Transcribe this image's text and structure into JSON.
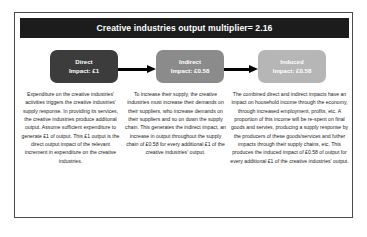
{
  "header": {
    "title": "Creative industries output multiplier= 2.16"
  },
  "flow": {
    "boxes": [
      {
        "name": "direct",
        "line1": "Direct",
        "line2": "Impact: £1",
        "color": "#3c3c3c"
      },
      {
        "name": "indirect",
        "line1": "Indirect",
        "line2": "Impact: £0.58",
        "color": "#8b8b8b"
      },
      {
        "name": "induced",
        "line1": "Induced",
        "line2": "Impact: £0.58",
        "color": "#b6b6b6"
      }
    ],
    "arrows": [
      {
        "name": "arrow-direct-to-indirect",
        "direction": "right"
      },
      {
        "name": "arrow-indirect-to-induced",
        "direction": "right"
      }
    ]
  },
  "columns": [
    {
      "name": "direct",
      "text": "Expenditure on the creative industries' activities triggers the creative industries' supply response. In providing its services, the creative industries produce additonal output. Assume sufficient expenditure to generate £1 of output. This £1 output is the direct output impact of the relevant increment in expenditure on the creative industries."
    },
    {
      "name": "indirect",
      "text": "To increase their supply, the creative industries must increase their demands on their suppliers, who increase demands on their suppliers and so on down the supply chain. This generates the indirect impact, an increase in output throughout the supply chain of £0.58 for every additional £1 of the creative industries' output."
    },
    {
      "name": "induced",
      "text": "The combined direct and indirect impacts have an impact on household income through the economy, through increased employment, profits, etc. A proportion of this income will be re-spent on final goods and servies, producing a supply response by the producers of these goods/services and futher impacts through their supply chains, etc. This produces the induced impact of £0.58 of output for every additional £1 of the creative industries' output."
    }
  ],
  "colors": {
    "header_background": "#1c1c1c",
    "header_text": "#ffffff",
    "frame_border": "#4a4a4a",
    "page_background": "#ffffff",
    "arrow": "#000000"
  }
}
